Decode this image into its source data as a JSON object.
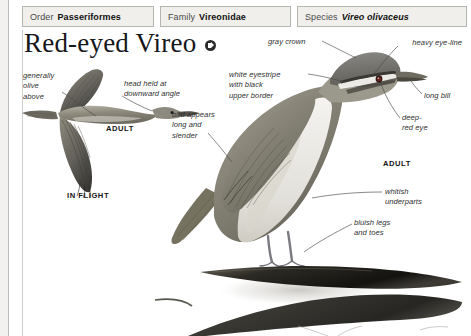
{
  "taxonomy": [
    {
      "key": "Order",
      "value": "Passeriformes",
      "italic": false,
      "name": "order"
    },
    {
      "key": "Family",
      "value": "Vireonidae",
      "italic": false,
      "name": "family"
    },
    {
      "key": "Species",
      "value": "Vireo olivaceus",
      "italic": true,
      "name": "species"
    }
  ],
  "title": {
    "text": "Red-eyed Vireo",
    "audio_icon": "speaker-icon"
  },
  "callouts": {
    "olive_above": "generally\nolive\nabove",
    "head_angle": "head held at\ndownward angle",
    "eyestripe": "white eyestripe\nwith black\nupper border",
    "long_slender": "bird appears\nlong and\nslender",
    "gray_crown": "gray crown",
    "heavy_eyeline": "heavy eye-line",
    "long_bill": "long bill",
    "deep_red_eye": "deep-\nred eye",
    "whitish_underparts": "whitish\nunderparts",
    "bluish_legs": "bluish legs\nand toes"
  },
  "plate_labels": {
    "adult_flight": "ADULT",
    "in_flight": "IN FLIGHT",
    "adult_perched": "ADULT"
  },
  "colors": {
    "page_background": "#ffffff",
    "margin": "#f2f1ef",
    "taxon_cell_fill": "#f0efec",
    "taxon_cell_border": "#b6b5b1",
    "text": "#2f2f2f",
    "title_text": "#16171a",
    "bird_olive": "#8d8a7c",
    "bird_gray": "#9b9b97",
    "bird_dark": "#4a4843",
    "branch": "#3a372f"
  }
}
